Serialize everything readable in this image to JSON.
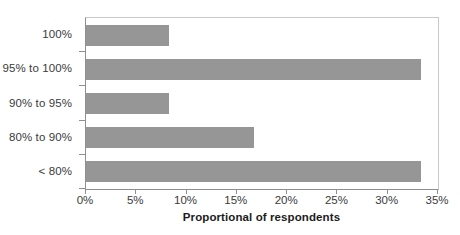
{
  "chart_data": {
    "type": "bar",
    "orientation": "horizontal",
    "title": "",
    "xlabel": "Proportional of respondents",
    "ylabel": "",
    "categories": [
      "100%",
      "95% to 100%",
      "90% to 95%",
      "80% to 90%",
      "< 80%"
    ],
    "values": [
      8.3,
      33.3,
      8.3,
      16.7,
      33.3
    ],
    "xlim": [
      0,
      35
    ],
    "xticks": [
      0,
      5,
      10,
      15,
      20,
      25,
      30,
      35
    ],
    "xtick_labels": [
      "0%",
      "5%",
      "10%",
      "15%",
      "20%",
      "25%",
      "30%",
      "35%"
    ],
    "grid": false,
    "legend": false,
    "bar_color": "#969696",
    "axis_color": "#8f8f8f",
    "text_color": "#3a3a3a",
    "background": "#ffffff"
  }
}
